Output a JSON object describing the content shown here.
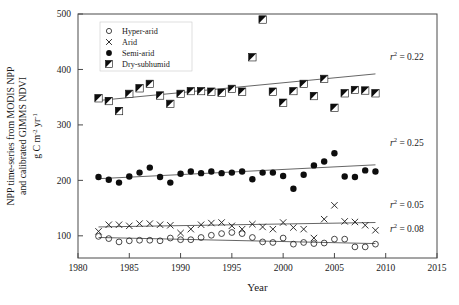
{
  "chart_data": {
    "type": "scatter",
    "title": "",
    "xlabel": "Year",
    "ylabel": "NPP time-series from MODIS NPP and calibrated GIMMS NDVI",
    "ylabel_lines": [
      "NPP time-series from MODIS NPP",
      "and calibrated GIMMS NDVI"
    ],
    "yunits": "g C m-2 yr-1",
    "xlim": [
      1980,
      2015
    ],
    "ylim": [
      60,
      500
    ],
    "xticks": [
      1980,
      1985,
      1990,
      1995,
      2000,
      2005,
      2010,
      2015
    ],
    "yticks": [
      100,
      200,
      300,
      400,
      500
    ],
    "grid": false,
    "legend_position": "top-left",
    "series": [
      {
        "name": "Hyper-arid",
        "marker": "open-circle",
        "r2_label": "0.08",
        "x": [
          1982,
          1983,
          1984,
          1985,
          1986,
          1987,
          1988,
          1989,
          1990,
          1991,
          1992,
          1993,
          1994,
          1995,
          1996,
          1997,
          1998,
          1999,
          2000,
          2001,
          2002,
          2003,
          2004,
          2005,
          2006,
          2007,
          2008,
          2009
        ],
        "values": [
          99,
          95,
          89,
          91,
          92,
          92,
          91,
          96,
          93,
          93,
          97,
          101,
          104,
          106,
          104,
          97,
          89,
          88,
          96,
          85,
          88,
          86,
          87,
          94,
          94,
          80,
          80,
          85
        ]
      },
      {
        "name": "Arid",
        "marker": "cross",
        "r2_label": "0.05",
        "x": [
          1982,
          1983,
          1984,
          1985,
          1986,
          1987,
          1988,
          1989,
          1990,
          1991,
          1992,
          1993,
          1994,
          1995,
          1996,
          1997,
          1998,
          1999,
          2000,
          2001,
          2002,
          2003,
          2004,
          2005,
          2006,
          2007,
          2008,
          2009
        ],
        "values": [
          108,
          120,
          120,
          118,
          122,
          122,
          120,
          119,
          105,
          112,
          120,
          123,
          124,
          118,
          112,
          121,
          116,
          112,
          124,
          115,
          112,
          96,
          130,
          155,
          126,
          125,
          119,
          110
        ]
      },
      {
        "name": "Semi-arid",
        "marker": "filled-circle",
        "r2_label": "0.25",
        "x": [
          1982,
          1983,
          1984,
          1985,
          1986,
          1987,
          1988,
          1989,
          1990,
          1991,
          1992,
          1993,
          1994,
          1995,
          1996,
          1997,
          1998,
          1999,
          2000,
          2001,
          2002,
          2003,
          2004,
          2005,
          2006,
          2007,
          2008,
          2009
        ],
        "values": [
          206,
          201,
          196,
          207,
          214,
          223,
          206,
          196,
          212,
          216,
          213,
          216,
          213,
          214,
          216,
          202,
          214,
          214,
          208,
          185,
          210,
          227,
          234,
          249,
          207,
          206,
          218,
          216
        ]
      },
      {
        "name": "Dry-subhumid",
        "marker": "half-square",
        "r2_label": "0.22",
        "x": [
          1982,
          1983,
          1984,
          1985,
          1986,
          1987,
          1988,
          1989,
          1990,
          1991,
          1992,
          1993,
          1994,
          1995,
          1996,
          1997,
          1998,
          1999,
          2000,
          2001,
          2002,
          2003,
          2004,
          2005,
          2006,
          2007,
          2008,
          2009
        ],
        "values": [
          348,
          343,
          325,
          356,
          366,
          374,
          353,
          338,
          356,
          361,
          361,
          360,
          358,
          365,
          360,
          422,
          490,
          360,
          340,
          361,
          374,
          352,
          383,
          331,
          357,
          363,
          362,
          357
        ]
      }
    ],
    "trendlines": [
      {
        "series": "Hyper-arid",
        "x1": 1982,
        "y1": 97,
        "x2": 2009,
        "y2": 86
      },
      {
        "series": "Arid",
        "x1": 1982,
        "y1": 116,
        "x2": 2009,
        "y2": 124
      },
      {
        "series": "Semi-arid",
        "x1": 1982,
        "y1": 203,
        "x2": 2009,
        "y2": 228
      },
      {
        "series": "Dry-subhumid",
        "x1": 1982,
        "y1": 344,
        "x2": 2009,
        "y2": 392
      }
    ],
    "annotations": [
      {
        "text": "r2 = 0.22",
        "value": "0.22",
        "series": "Dry-subhumid"
      },
      {
        "text": "r2 = 0.25",
        "value": "0.25",
        "series": "Semi-arid"
      },
      {
        "text": "r2 = 0.05",
        "value": "0.05",
        "series": "Arid"
      },
      {
        "text": "r2 = 0.08",
        "value": "0.08",
        "series": "Hyper-arid"
      }
    ]
  },
  "legend": {
    "items": [
      {
        "label": "Hyper-arid"
      },
      {
        "label": "Arid"
      },
      {
        "label": "Semi-arid"
      },
      {
        "label": "Dry-subhumid"
      }
    ]
  },
  "axes": {
    "x_title": "Year",
    "y_line1": "NPP time-series from MODIS NPP",
    "y_line2": "and calibrated GIMMS NDVI",
    "y_units_main": "g C m",
    "y_units_sup1": "-2",
    "y_units_mid": " yr",
    "y_units_sup2": "-1",
    "xticklabels": [
      "1980",
      "1985",
      "1990",
      "1995",
      "2000",
      "2005",
      "2010",
      "2015"
    ],
    "yticklabels": [
      "100",
      "200",
      "300",
      "400",
      "500"
    ]
  },
  "r2_prefix": "r",
  "r2_sup": "2",
  "r2_eq": " = "
}
